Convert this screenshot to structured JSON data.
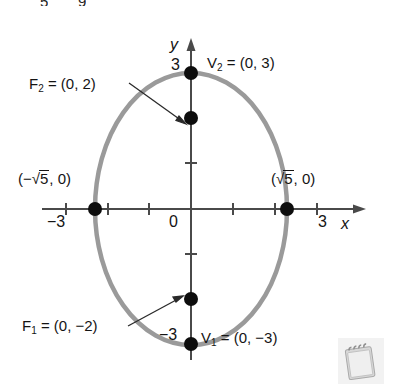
{
  "figure": {
    "title_fragment_top": [
      "5",
      "9"
    ],
    "type": "ellipse-graph",
    "center": [
      0,
      0
    ],
    "axes": {
      "x_label": "x",
      "y_label": "y",
      "x_ticks": [
        -3,
        -2,
        -1,
        0,
        1,
        2,
        3
      ],
      "y_ticks": [
        -3,
        -2,
        -1,
        0,
        1,
        2,
        3
      ],
      "x_tick_labels_shown": [
        "-3",
        "3"
      ],
      "y_tick_labels_shown": [
        "3",
        "-3"
      ],
      "origin_label": "0",
      "x_tick_left_label": "−3",
      "x_tick_right_label": "3",
      "y_tick_top_label": "3",
      "y_tick_bottom_label": "−3"
    },
    "curve": {
      "shape": "ellipse",
      "semi_major_axis_a": 3,
      "semi_major_orientation": "vertical",
      "semi_minor_axis_b": 2.236,
      "color": "#9a9a9a",
      "stroke_width": 4
    },
    "points": [
      {
        "name": "vertex-top",
        "label": "V",
        "sub": "2",
        "coords": "(0, 3)",
        "x": 0,
        "y": 3
      },
      {
        "name": "focus-top",
        "label": "F",
        "sub": "2",
        "coords": "(0, 2)",
        "x": 0,
        "y": 2
      },
      {
        "name": "focus-bottom",
        "label": "F",
        "sub": "1",
        "coords": "(0, −2)",
        "x": 0,
        "y": -2
      },
      {
        "name": "vertex-bottom",
        "label": "V",
        "sub": "1",
        "coords": "(0, −3)",
        "x": 0,
        "y": -3
      },
      {
        "name": "co-vertex-left",
        "label": "",
        "sub": "",
        "coords": "(−√5, 0)",
        "x": -2.236,
        "y": 0
      },
      {
        "name": "co-vertex-right",
        "label": "",
        "sub": "",
        "coords": "(√5, 0)",
        "x": 2.236,
        "y": 0
      }
    ],
    "labels": {
      "vertex_top": {
        "name": "V",
        "sub": "2",
        "eq": " = (0, 3)"
      },
      "focus_top": {
        "name": "F",
        "sub": "2",
        "eq": " = (0, 2)"
      },
      "focus_bottom": {
        "name": "F",
        "sub": "1",
        "eq": " = (0, −2)"
      },
      "vertex_bottom": {
        "name": "V",
        "sub": "1",
        "eq": " = (0, −3)"
      },
      "covertex_left_pre": "(−",
      "covertex_left_rad": "5",
      "covertex_left_post": ", 0)",
      "covertex_right_pre": "(",
      "covertex_right_rad": "5",
      "covertex_right_post": ", 0)"
    },
    "annotations": [
      {
        "name": "arrow-to-focus-top",
        "from": [
          131,
          84
        ],
        "to": [
          183,
          122
        ]
      },
      {
        "name": "arrow-to-focus-bottom",
        "from": [
          131,
          325
        ],
        "to": [
          180,
          297
        ]
      }
    ],
    "decoration": {
      "notepad_icon": "notepad-icon"
    },
    "colors": {
      "curve": "#9a9a9a",
      "axis": "#4a4a4a",
      "point": "#0d0d0d",
      "text": "#141414"
    }
  }
}
